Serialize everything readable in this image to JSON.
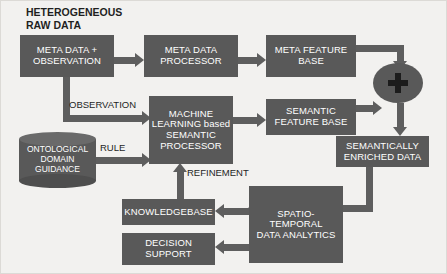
{
  "diagram": {
    "title_lines": "HETEROGENEOUS\nRAW DATA",
    "background_color": "#f2f1ef",
    "node_color": "#595959",
    "node_text_color": "#ffffff",
    "arrow_color": "#5e5e5e",
    "label_text_color": "#1f1f1f"
  },
  "nodes": {
    "meta_data_observation": "META DATA +\nOBSERVATION",
    "meta_data_processor": "META DATA\nPROCESSOR",
    "meta_feature_base": "META FEATURE\nBASE",
    "machine_learning_processor": "MACHINE\nLEARNING based\nSEMANTIC\nPROCESSOR",
    "semantic_feature_base": "SEMANTIC\nFEATURE BASE",
    "ontological_domain_guidance": "ONTOLOGICAL\nDOMAIN\nGUIDANCE",
    "semantically_enriched_data": "SEMANTICALLY\nENRICHED DATA",
    "spatio_temporal_data_analytics": "SPATIO-TEMPORAL\nDATA  ANALYTICS",
    "knowledgebase": "KNOWLEDGEBASE",
    "decision_support": "DECISION\nSUPPORT",
    "combiner_symbol": "+"
  },
  "edge_labels": {
    "observation": "OBSERVATION",
    "rule": "RULE",
    "refinement": "REFINEMENT"
  }
}
